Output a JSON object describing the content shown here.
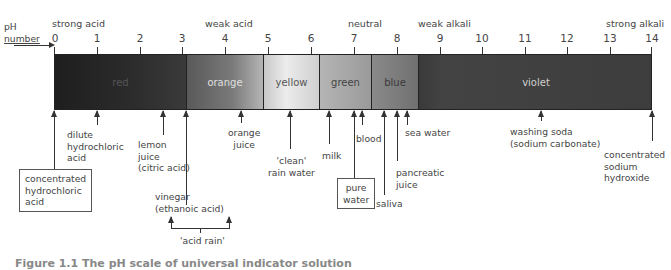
{
  "axis": {
    "label_line1": "pH",
    "label_line2": "number",
    "ticks": [
      "0",
      "1",
      "2",
      "3",
      "4",
      "5",
      "6",
      "7",
      "8",
      "9",
      "10",
      "11",
      "12",
      "13",
      "14"
    ]
  },
  "regions": {
    "strong_acid": "strong acid",
    "weak_acid": "weak acid",
    "neutral": "neutral",
    "weak_alkali": "weak alkali",
    "strong_alkali": "strong alkali"
  },
  "colour_bands": [
    {
      "label": "red",
      "from": 0,
      "to": 3.1,
      "color": "#2a2a2a"
    },
    {
      "label": "orange",
      "from": 3.1,
      "to": 4.9,
      "color": "#6a6a6a"
    },
    {
      "label": "yellow",
      "from": 4.9,
      "to": 6.2,
      "color": "#cfcfcf"
    },
    {
      "label": "green",
      "from": 6.2,
      "to": 7.4,
      "color": "#a0a0a0"
    },
    {
      "label": "blue",
      "from": 7.4,
      "to": 8.5,
      "color": "#7d7d7d"
    },
    {
      "label": "violet",
      "from": 8.5,
      "to": 14,
      "color": "#3c3c3c"
    }
  ],
  "substances": {
    "conc_hcl": "concentrated\nhydrochloric\nacid",
    "dilute_hcl": "dilute\nhydrochloric\nacid",
    "lemon": "lemon\njuice\n(citric acid)",
    "vinegar": "vinegar\n(ethanoic acid)",
    "orange_juice": "orange\njuice",
    "clean_rain": "'clean'\nrain water",
    "milk": "milk",
    "pure_water": "pure\nwater",
    "blood": "blood",
    "saliva": "saliva",
    "pancreatic": "pancreatic\njuice",
    "sea_water": "sea water",
    "washing_soda": "washing soda\n(sodium carbonate)",
    "conc_naoh": "concentrated\nsodium\nhydroxide",
    "acid_rain": "'acid rain'"
  },
  "caption": "Figure 1.1 The pH scale of universal indicator solution"
}
